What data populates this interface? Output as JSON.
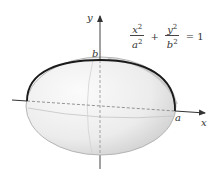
{
  "diagram": {
    "type": "ellipsoid-of-revolution",
    "labels": {
      "x_axis": "x",
      "y_axis": "y",
      "semi_major": "a",
      "semi_minor": "b"
    },
    "equation": {
      "term1": {
        "num": "x",
        "num_exp": "2",
        "den": "a",
        "den_exp": "2"
      },
      "plus": "+",
      "term2": {
        "num": "y",
        "num_exp": "2",
        "den": "b",
        "den_exp": "2"
      },
      "equals": "= 1"
    },
    "colors": {
      "curve": "#1a1a1a",
      "axis": "#333333",
      "surface_light": "#f4f4f4",
      "surface_shade": "#d8d8d8",
      "dashed": "#888888"
    }
  }
}
